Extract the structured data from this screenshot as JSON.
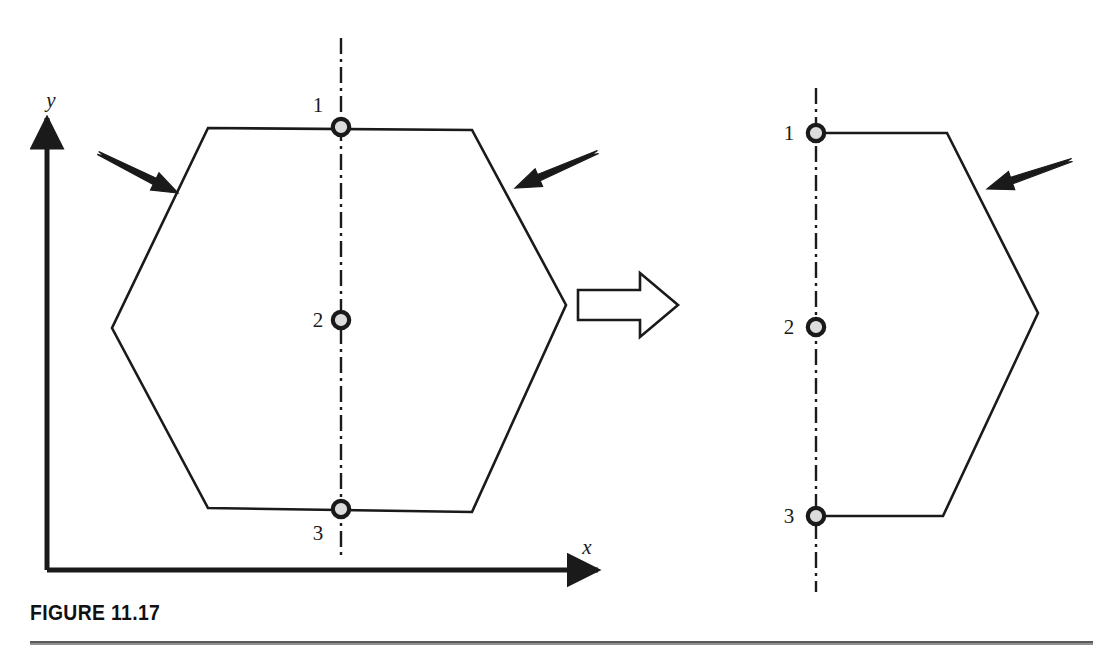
{
  "figure": {
    "caption": "FIGURE 11.17",
    "stroke_color": "#1a1a1a",
    "node_fill_color": "#dcdcdc",
    "background_color": "#ffffff",
    "rule_color": "#8f8f8f"
  },
  "axes": {
    "x_label": "x",
    "y_label": "y",
    "origin": {
      "x": 47,
      "y": 570
    },
    "x_end": {
      "x": 598,
      "y": 570
    },
    "y_end": {
      "x": 47,
      "y": 118
    }
  },
  "left_shape": {
    "name": "hexagon-full",
    "vertices": [
      {
        "x": 208,
        "y": 128
      },
      {
        "x": 472,
        "y": 130
      },
      {
        "x": 566,
        "y": 305
      },
      {
        "x": 472,
        "y": 512
      },
      {
        "x": 208,
        "y": 508
      },
      {
        "x": 112,
        "y": 328
      }
    ],
    "centerline": {
      "x": 341,
      "y_top": 38,
      "y_bottom": 560
    },
    "nodes": [
      {
        "label": "1",
        "x": 341,
        "y": 127,
        "label_x": 318,
        "label_y": 112
      },
      {
        "label": "2",
        "x": 341,
        "y": 320,
        "label_x": 318,
        "label_y": 327
      },
      {
        "label": "3",
        "x": 341,
        "y": 509,
        "label_x": 318,
        "label_y": 540
      }
    ],
    "arrows": [
      {
        "name": "load-arrow-left",
        "x1": 98,
        "y1": 153,
        "x2": 178,
        "y2": 193
      },
      {
        "name": "load-arrow-right",
        "x1": 598,
        "y1": 152,
        "x2": 515,
        "y2": 188
      }
    ]
  },
  "transform_arrow": {
    "name": "block-arrow",
    "x": 578,
    "y": 273,
    "width": 100,
    "height": 64,
    "shaft_height": 30,
    "head_width": 38
  },
  "right_shape": {
    "name": "hexagon-half",
    "vertices": [
      {
        "x": 816,
        "y": 133
      },
      {
        "x": 947,
        "y": 133
      },
      {
        "x": 1038,
        "y": 313
      },
      {
        "x": 943,
        "y": 516
      },
      {
        "x": 816,
        "y": 516
      }
    ],
    "centerline": {
      "x": 816,
      "y_top": 88,
      "y_bottom": 592
    },
    "nodes": [
      {
        "label": "1",
        "x": 816,
        "y": 133,
        "label_x": 789,
        "label_y": 140
      },
      {
        "label": "2",
        "x": 816,
        "y": 327,
        "label_x": 789,
        "label_y": 334
      },
      {
        "label": "3",
        "x": 816,
        "y": 516,
        "label_x": 789,
        "label_y": 523
      }
    ],
    "arrows": [
      {
        "name": "load-arrow-right",
        "x1": 1072,
        "y1": 160,
        "x2": 987,
        "y2": 189
      }
    ]
  }
}
